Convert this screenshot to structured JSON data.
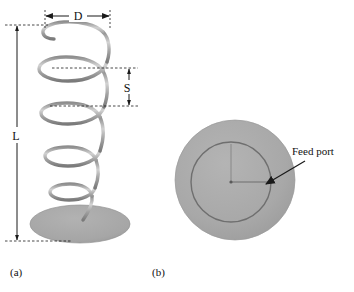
{
  "figure": {
    "background_color": "#ffffff",
    "panels": [
      {
        "id": "panel-a",
        "caption": "(a)",
        "caption_x": 10,
        "caption_y": 276,
        "description": "side view of conical helical spring on circular base",
        "dimensions": [
          {
            "name": "diameter",
            "label": "D",
            "label_x": 77,
            "label_y": 18,
            "orientation": "horizontal"
          },
          {
            "name": "pitch",
            "label": "S",
            "label_x": 123,
            "label_y": 90,
            "orientation": "vertical"
          },
          {
            "name": "length",
            "label": "L",
            "label_x": 18,
            "label_y": 137,
            "orientation": "vertical"
          }
        ]
      },
      {
        "id": "panel-b",
        "caption": "(b)",
        "caption_x": 152,
        "caption_y": 276,
        "description": "top view of spring on circular ground plane with feed point",
        "annotations": [
          {
            "name": "feed-port",
            "label": "Feed port",
            "label_x": 292,
            "label_y": 155
          }
        ]
      }
    ],
    "colors": {
      "metal_gray": "#a9a9a9",
      "metal_light": "#cfcfcf",
      "metal_dark": "#7d7d7d",
      "disc_gray": "#a8a8a8",
      "disc_edge": "#8f8f8f",
      "line_black": "#1a1a1a",
      "text_black": "#111111"
    }
  }
}
